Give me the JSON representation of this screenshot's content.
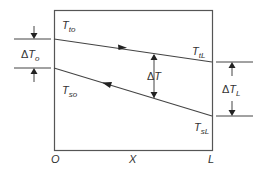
{
  "diagram": {
    "type": "counterflow-temperature-profile",
    "colors": {
      "line": "#444444",
      "box": "#555555",
      "text": "#333333"
    },
    "labels": {
      "T_to": {
        "main": "T",
        "sub": "to"
      },
      "T_tL": {
        "main": "T",
        "sub": "tL"
      },
      "T_so": {
        "main": "T",
        "sub": "so"
      },
      "T_sL": {
        "main": "T",
        "sub": "sL"
      },
      "dT_o": {
        "delta": "Δ",
        "main": "T",
        "sub": "o"
      },
      "dT": {
        "delta": "Δ",
        "main": "T"
      },
      "dT_L": {
        "delta": "Δ",
        "main": "T",
        "sub": "L"
      }
    },
    "axis": {
      "origin": "O",
      "mid": "X",
      "end": "L"
    },
    "flows": [
      {
        "name": "tube-side",
        "from": "T_to",
        "to": "T_tL",
        "direction": "left-to-right"
      },
      {
        "name": "shell-side",
        "from": "T_sL",
        "to": "T_so",
        "direction": "right-to-left"
      }
    ]
  }
}
